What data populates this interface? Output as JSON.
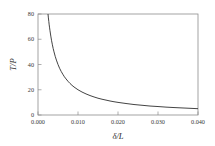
{
  "chart_data": {
    "type": "line",
    "title": "",
    "xlabel": "δ/L",
    "ylabel": "T/P",
    "xlim": [
      0.0,
      0.04
    ],
    "ylim": [
      0.0,
      80.0
    ],
    "xticks": [
      0.0,
      0.01,
      0.02,
      0.03,
      0.04
    ],
    "xtick_labels": [
      "0.000",
      "0.010",
      "0.020",
      "0.030",
      "0.040"
    ],
    "yticks": [
      0,
      20,
      40,
      60,
      80
    ],
    "ytick_labels": [
      "0",
      "20",
      "40",
      "60",
      "80"
    ],
    "grid": false,
    "legend": null,
    "series": [
      {
        "name": "T/P = 0.2/(δ/L)",
        "relation": "y = 0.2 / x",
        "color": "#2e2e2e",
        "linewidth": 0.9,
        "x": [
          0.0025,
          0.0026,
          0.0027,
          0.0028,
          0.0029,
          0.003,
          0.0032,
          0.0034,
          0.0036,
          0.0038,
          0.004,
          0.0043,
          0.0046,
          0.005,
          0.0054,
          0.0058,
          0.0062,
          0.0066,
          0.007,
          0.0075,
          0.008,
          0.0085,
          0.009,
          0.0095,
          0.01,
          0.011,
          0.012,
          0.013,
          0.014,
          0.015,
          0.016,
          0.017,
          0.018,
          0.019,
          0.02,
          0.022,
          0.024,
          0.026,
          0.028,
          0.03,
          0.032,
          0.034,
          0.036,
          0.038,
          0.04
        ],
        "y": [
          80.0,
          76.9,
          74.1,
          71.4,
          69.0,
          66.7,
          62.5,
          58.8,
          55.6,
          52.6,
          50.0,
          46.5,
          43.5,
          40.0,
          37.0,
          34.5,
          32.3,
          30.3,
          28.6,
          26.7,
          25.0,
          23.5,
          22.2,
          21.1,
          20.0,
          18.2,
          16.7,
          15.4,
          14.3,
          13.3,
          12.5,
          11.8,
          11.1,
          10.5,
          10.0,
          9.1,
          8.3,
          7.7,
          7.1,
          6.7,
          6.25,
          5.9,
          5.6,
          5.3,
          5.0
        ]
      }
    ],
    "annotations": []
  },
  "axes": {
    "y_axis_title": "T/P",
    "x_axis_title": "δ/L"
  }
}
